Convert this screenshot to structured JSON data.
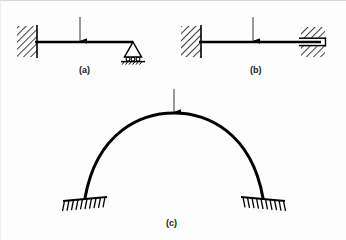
{
  "figure": {
    "width": 346,
    "height": 240,
    "background": "#fdfdfd",
    "line_color": "#000000",
    "panels": [
      {
        "id": "a",
        "caption": "(a)",
        "description": "Beam fixed at left wall, roller support at right, point load at midspan",
        "left_support": "fixed-wall-hatched",
        "right_support": "roller-triangle",
        "load": "downward-point-load"
      },
      {
        "id": "b",
        "caption": "(b)",
        "description": "Beam fixed at left wall, guided sliding support at right, point load at midspan",
        "left_support": "fixed-wall-hatched",
        "right_support": "guided-slider-hatched",
        "load": "downward-point-load"
      },
      {
        "id": "c",
        "caption": "(c)",
        "description": "Two-hinged circular arch with inclined hatched supports at both springings, point load at crown",
        "left_support": "inclined-hatched-ground",
        "right_support": "inclined-hatched-ground",
        "load": "downward-point-load"
      }
    ]
  },
  "captions": {
    "a": "(a)",
    "b": "(b)",
    "c": "(c)"
  }
}
